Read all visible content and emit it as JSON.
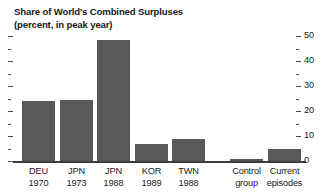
{
  "chart_data": {
    "type": "bar",
    "title": "Share of World's Combined Surpluses",
    "subtitle": "(percent, in peak year)",
    "xlabel": "",
    "ylabel": "",
    "ylim": [
      0,
      50
    ],
    "y_ticks_major": [
      0,
      10,
      20,
      30,
      40,
      50
    ],
    "y_ticks_minor": [
      5,
      15,
      25,
      35,
      45
    ],
    "y_tick_labels": [
      "0",
      "10",
      "20",
      "30",
      "40",
      "50"
    ],
    "grid": false,
    "legend": "none",
    "axis_position": "right",
    "bar_color": "#595959",
    "categories": [
      {
        "line1": "DEU",
        "line2": "1970"
      },
      {
        "line1": "JPN",
        "line2": "1973"
      },
      {
        "line1": "JPN",
        "line2": "1988"
      },
      {
        "line1": "KOR",
        "line2": "1989"
      },
      {
        "line1": "TWN",
        "line2": "1988"
      },
      {
        "line1": "Control",
        "line2": "group"
      },
      {
        "line1": "Current",
        "line2": "episodes"
      }
    ],
    "values": [
      24,
      24.5,
      48.5,
      7,
      9,
      1,
      5
    ],
    "series": [
      {
        "name": "Share of World's Combined Surpluses",
        "values": [
          24,
          24.5,
          48.5,
          7,
          9,
          1,
          5
        ]
      }
    ]
  }
}
